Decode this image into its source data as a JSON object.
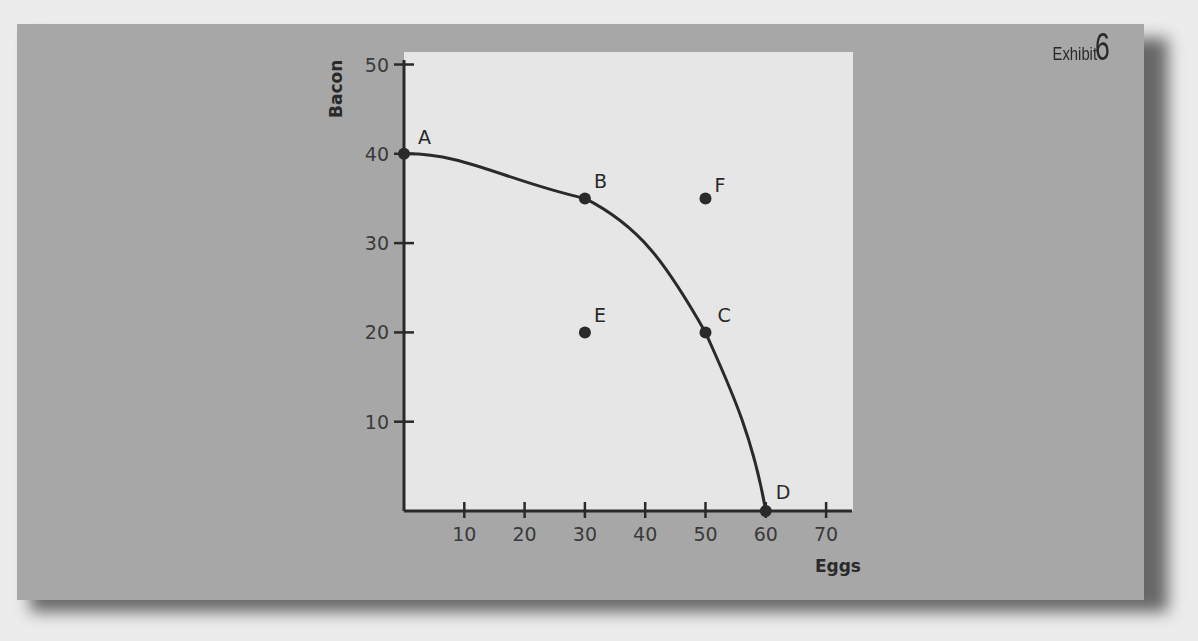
{
  "exhibit": {
    "word": "Exhibit",
    "number": "6"
  },
  "chart_data": {
    "type": "scatter",
    "title": "Exhibit 6",
    "subtitle": "Production possibilities frontier",
    "xlabel": "Eggs",
    "ylabel": "Bacon",
    "xlim": [
      0,
      70
    ],
    "ylim": [
      0,
      50
    ],
    "x_ticks": [
      10,
      20,
      30,
      40,
      50,
      60,
      70
    ],
    "y_ticks": [
      10,
      20,
      30,
      40,
      50
    ],
    "grid": false,
    "legend": null,
    "curve": {
      "name": "PPF",
      "points": [
        {
          "label": "A",
          "x": 0,
          "y": 40
        },
        {
          "label": "B",
          "x": 30,
          "y": 35
        },
        {
          "label": "C",
          "x": 50,
          "y": 20
        },
        {
          "label": "D",
          "x": 60,
          "y": 0
        }
      ]
    },
    "points": [
      {
        "label": "A",
        "x": 0,
        "y": 40,
        "on_curve": true
      },
      {
        "label": "B",
        "x": 30,
        "y": 35,
        "on_curve": true
      },
      {
        "label": "C",
        "x": 50,
        "y": 20,
        "on_curve": true
      },
      {
        "label": "D",
        "x": 60,
        "y": 0,
        "on_curve": true
      },
      {
        "label": "E",
        "x": 30,
        "y": 20,
        "on_curve": false
      },
      {
        "label": "F",
        "x": 50,
        "y": 35,
        "on_curve": false
      }
    ]
  },
  "colors": {
    "panel": "#a7a7a7",
    "plot_area": "#e6e6e6",
    "ink": "#2a2a2a"
  }
}
